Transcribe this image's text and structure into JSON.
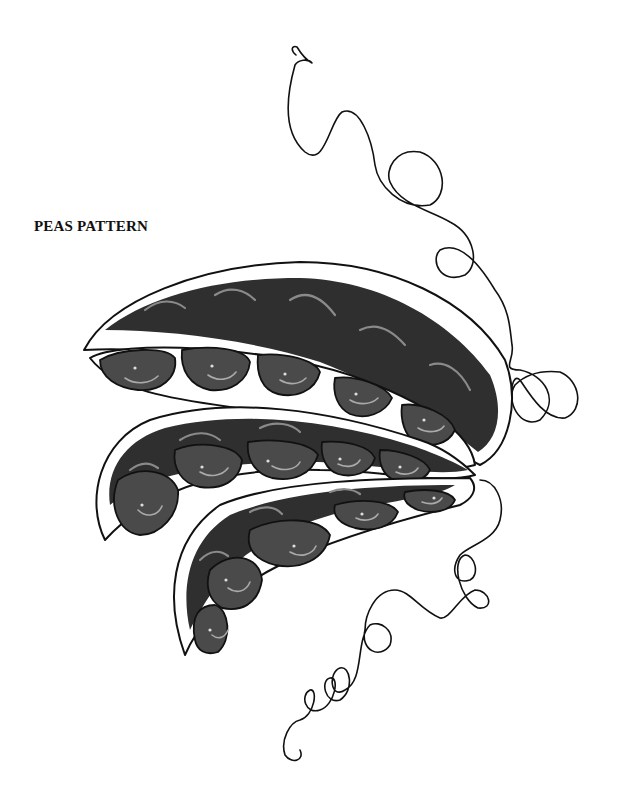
{
  "page": {
    "title": "PEAS PATTERN",
    "background": "#ffffff"
  },
  "illustration": {
    "subject": "three-pea-pods-with-tendrils",
    "pod_count": 3,
    "colors": {
      "outline": "#111111",
      "pod_fill": "#2f2f2f",
      "pea_fill": "#4a4a4a",
      "highlight": "#8a8a8a"
    }
  }
}
